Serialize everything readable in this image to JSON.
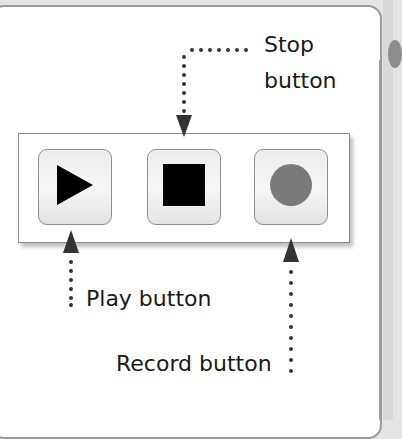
{
  "controls": {
    "buttons": [
      {
        "name": "Play",
        "icon": "play-icon",
        "icon_color": "#000000"
      },
      {
        "name": "Stop",
        "icon": "stop-icon",
        "icon_color": "#000000"
      },
      {
        "name": "Record",
        "icon": "record-icon",
        "icon_color": "#7a7a7a"
      }
    ]
  },
  "callouts": {
    "stop_line1": "Stop",
    "stop_line2": "button",
    "play": "Play button",
    "record": "Record button"
  },
  "colors": {
    "background": "#e4e4e4",
    "panel": "#ffffff",
    "arrow": "#333333",
    "record_dot": "#7a7a7a"
  }
}
